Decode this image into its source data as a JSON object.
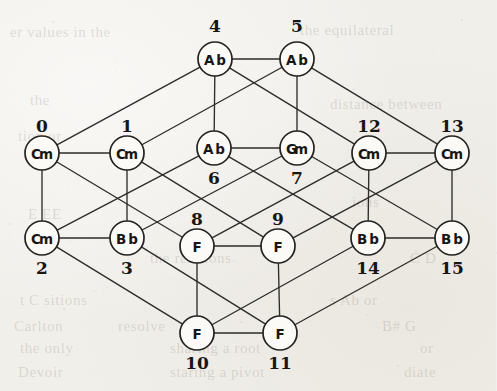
{
  "figure": {
    "type": "graph-diagram",
    "title": "",
    "background_color": "#f1efea",
    "node_fill_color": "#fbfaf7",
    "node_stroke_color": "#24221f",
    "edge_color": "#2e2c2a",
    "node_radius": 17
  },
  "nodes": [
    {
      "id": 0,
      "index_label": "0",
      "chord": "Cm",
      "cx": 42,
      "cy": 153,
      "index_x": 42,
      "index_y": 126
    },
    {
      "id": 1,
      "index_label": "1",
      "chord": "Cm",
      "cx": 127,
      "cy": 153,
      "index_x": 127,
      "index_y": 126
    },
    {
      "id": 2,
      "index_label": "2",
      "chord": "Cm",
      "cx": 42,
      "cy": 238,
      "index_x": 42,
      "index_y": 268
    },
    {
      "id": 3,
      "index_label": "3",
      "chord": "Bb",
      "cx": 127,
      "cy": 238,
      "index_x": 127,
      "index_y": 268
    },
    {
      "id": 4,
      "index_label": "4",
      "chord": "Ab",
      "cx": 215,
      "cy": 59,
      "index_x": 215,
      "index_y": 26
    },
    {
      "id": 5,
      "index_label": "5",
      "chord": "Ab",
      "cx": 297,
      "cy": 59,
      "index_x": 297,
      "index_y": 26
    },
    {
      "id": 6,
      "index_label": "6",
      "chord": "Ab",
      "cx": 214,
      "cy": 148,
      "index_x": 214,
      "index_y": 178
    },
    {
      "id": 7,
      "index_label": "7",
      "chord": "Gm",
      "cx": 297,
      "cy": 148,
      "index_x": 297,
      "index_y": 178
    },
    {
      "id": 8,
      "index_label": "8",
      "chord": "F",
      "cx": 197,
      "cy": 246,
      "index_x": 197,
      "index_y": 219
    },
    {
      "id": 9,
      "index_label": "9",
      "chord": "F",
      "cx": 278,
      "cy": 246,
      "index_x": 278,
      "index_y": 219
    },
    {
      "id": 10,
      "index_label": "10",
      "chord": "F",
      "cx": 197,
      "cy": 333,
      "index_x": 197,
      "index_y": 363
    },
    {
      "id": 11,
      "index_label": "11",
      "chord": "F",
      "cx": 280,
      "cy": 333,
      "index_x": 280,
      "index_y": 363
    },
    {
      "id": 12,
      "index_label": "12",
      "chord": "Cm",
      "cx": 369,
      "cy": 153,
      "index_x": 369,
      "index_y": 126
    },
    {
      "id": 13,
      "index_label": "13",
      "chord": "Cm",
      "cx": 452,
      "cy": 153,
      "index_x": 452,
      "index_y": 126
    },
    {
      "id": 14,
      "index_label": "14",
      "chord": "Bb",
      "cx": 368,
      "cy": 238,
      "index_x": 368,
      "index_y": 268
    },
    {
      "id": 15,
      "index_label": "15",
      "chord": "Bb",
      "cx": 452,
      "cy": 238,
      "index_x": 452,
      "index_y": 268
    }
  ],
  "edges": [
    [
      0,
      1
    ],
    [
      0,
      2
    ],
    [
      0,
      4
    ],
    [
      0,
      8
    ],
    [
      1,
      3
    ],
    [
      1,
      5
    ],
    [
      1,
      9
    ],
    [
      2,
      3
    ],
    [
      2,
      6
    ],
    [
      2,
      10
    ],
    [
      3,
      7
    ],
    [
      3,
      11
    ],
    [
      4,
      5
    ],
    [
      4,
      6
    ],
    [
      4,
      12
    ],
    [
      5,
      7
    ],
    [
      5,
      13
    ],
    [
      6,
      7
    ],
    [
      6,
      14
    ],
    [
      7,
      15
    ],
    [
      8,
      9
    ],
    [
      8,
      10
    ],
    [
      8,
      12
    ],
    [
      9,
      11
    ],
    [
      9,
      13
    ],
    [
      10,
      11
    ],
    [
      10,
      14
    ],
    [
      11,
      15
    ],
    [
      12,
      13
    ],
    [
      12,
      14
    ],
    [
      13,
      15
    ],
    [
      14,
      15
    ]
  ],
  "ghost_text": [
    {
      "text": "er values in the",
      "x": 10,
      "y": 24
    },
    {
      "text": "the equilateral",
      "x": 300,
      "y": 22
    },
    {
      "text": "the",
      "x": 30,
      "y": 92
    },
    {
      "text": "distance between",
      "x": 330,
      "y": 96
    },
    {
      "text": "tion or",
      "x": 18,
      "y": 128
    },
    {
      "text": "ions",
      "x": 352,
      "y": 194
    },
    {
      "text": "E   EE",
      "x": 28,
      "y": 206
    },
    {
      "text": "the relations",
      "x": 150,
      "y": 250
    },
    {
      "text": "C   D",
      "x": 410,
      "y": 250
    },
    {
      "text": "t  C  sitions",
      "x": 20,
      "y": 292
    },
    {
      "text": "s  Ab   or",
      "x": 330,
      "y": 292
    },
    {
      "text": "Carlton",
      "x": 14,
      "y": 318
    },
    {
      "text": "resolve",
      "x": 118,
      "y": 318
    },
    {
      "text": "B# G",
      "x": 382,
      "y": 318
    },
    {
      "text": "the only",
      "x": 20,
      "y": 340
    },
    {
      "text": "sharing a root",
      "x": 170,
      "y": 340
    },
    {
      "text": "or",
      "x": 420,
      "y": 340
    },
    {
      "text": "Devoir",
      "x": 18,
      "y": 364
    },
    {
      "text": "staring a pivot",
      "x": 170,
      "y": 364
    },
    {
      "text": "diate",
      "x": 404,
      "y": 364
    }
  ]
}
